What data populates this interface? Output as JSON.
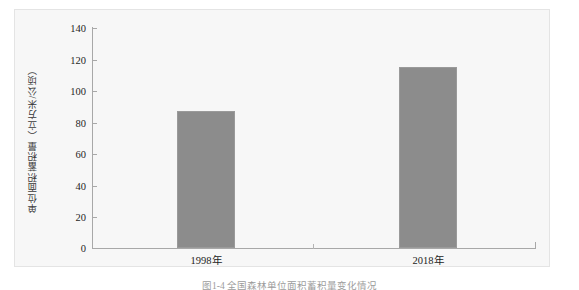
{
  "chart_data": {
    "type": "bar",
    "title": "",
    "subtitle": "",
    "xlabel": "",
    "ylabel": "单位面积蓄积量（立方米/公顷）",
    "categories": [
      "1998年",
      "2018年"
    ],
    "values": [
      87,
      115
    ],
    "series": [
      {
        "name": "单位面积蓄积量",
        "values": [
          87,
          115
        ]
      }
    ],
    "ylim": [
      0,
      140
    ],
    "ytick_labels": [
      "0",
      "20",
      "40",
      "60",
      "80",
      "100",
      "120",
      "140"
    ],
    "ytick_values": [
      0,
      20,
      40,
      60,
      80,
      100,
      120,
      140
    ],
    "grid": false,
    "legend": false,
    "legend_position": "none",
    "bar_color": "#8c8c8c",
    "axis_color": "#a8a8a8",
    "plot_background": "#f7f7f7"
  },
  "figure": {
    "caption": "图1-4  全国森林单位面积蓄积量变化情况"
  }
}
